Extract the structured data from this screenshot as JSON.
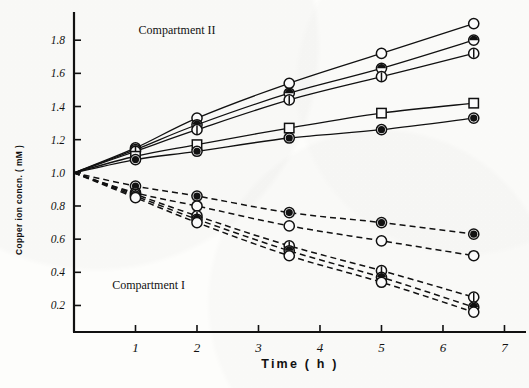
{
  "chart_data": {
    "type": "line",
    "title": "",
    "xlabel": "Time ( h )",
    "ylabel": "Copper ion concn. ( mM )",
    "xlim": [
      0,
      7.35
    ],
    "ylim": [
      0.04,
      1.97
    ],
    "xticks": [
      1,
      2,
      3,
      4,
      5,
      6,
      7
    ],
    "xtick_labels": [
      "1",
      "2",
      "3",
      "4",
      "5",
      "6",
      "7"
    ],
    "yticks": [
      0.2,
      0.4,
      0.6,
      0.8,
      1.0,
      1.2,
      1.4,
      1.6,
      1.8
    ],
    "ytick_labels": [
      "0.2",
      "0.4",
      "0.6",
      "0.8",
      "1.0",
      "1.2",
      "1.4",
      "1.6",
      "1.8"
    ],
    "grid": false,
    "legend_position": "none",
    "annotations": [
      {
        "text": "Compartment II",
        "x": 1.05,
        "y": 1.84,
        "name": "compartment-2-label"
      },
      {
        "text": "Compartment I",
        "x": 0.62,
        "y": 0.3,
        "name": "compartment-1-label"
      }
    ],
    "x": [
      0,
      1,
      2,
      3.5,
      5,
      6.5
    ],
    "series": [
      {
        "name": "II-a",
        "compartment": "Compartment II",
        "linestyle": "solid",
        "marker": "circle-open",
        "values": [
          1.0,
          1.15,
          1.33,
          1.54,
          1.72,
          1.9
        ]
      },
      {
        "name": "II-b",
        "compartment": "Compartment II",
        "linestyle": "solid",
        "marker": "circle-half-top",
        "values": [
          1.0,
          1.14,
          1.29,
          1.48,
          1.63,
          1.8
        ]
      },
      {
        "name": "II-c",
        "compartment": "Compartment II",
        "linestyle": "solid",
        "marker": "circle-vbar",
        "values": [
          1.0,
          1.13,
          1.26,
          1.44,
          1.58,
          1.72
        ]
      },
      {
        "name": "II-d",
        "compartment": "Compartment II",
        "linestyle": "solid",
        "marker": "square-open",
        "values": [
          1.0,
          1.1,
          1.17,
          1.27,
          1.36,
          1.42
        ]
      },
      {
        "name": "II-e",
        "compartment": "Compartment II",
        "linestyle": "solid",
        "marker": "circle-filled",
        "values": [
          1.0,
          1.08,
          1.13,
          1.21,
          1.26,
          1.33
        ]
      },
      {
        "name": "I-a",
        "compartment": "Compartment I",
        "linestyle": "dashed",
        "marker": "circle-filled",
        "values": [
          1.0,
          0.92,
          0.86,
          0.76,
          0.7,
          0.63
        ]
      },
      {
        "name": "I-b",
        "compartment": "Compartment I",
        "linestyle": "dashed",
        "marker": "circle-open",
        "values": [
          1.0,
          0.88,
          0.8,
          0.68,
          0.59,
          0.5
        ]
      },
      {
        "name": "I-c",
        "compartment": "Compartment I",
        "linestyle": "dashed",
        "marker": "circle-vbar",
        "values": [
          1.0,
          0.87,
          0.74,
          0.56,
          0.41,
          0.25
        ]
      },
      {
        "name": "I-d",
        "compartment": "Compartment I",
        "linestyle": "dashed",
        "marker": "circle-half-top",
        "values": [
          1.0,
          0.86,
          0.72,
          0.53,
          0.37,
          0.19
        ]
      },
      {
        "name": "I-e",
        "compartment": "Compartment I",
        "linestyle": "dashed",
        "marker": "circle-open-2",
        "values": [
          1.0,
          0.85,
          0.7,
          0.5,
          0.34,
          0.16
        ]
      }
    ]
  },
  "axis": {
    "y_title": "Copper ion concn. ( mM )",
    "x_title": "Time ( h )"
  }
}
